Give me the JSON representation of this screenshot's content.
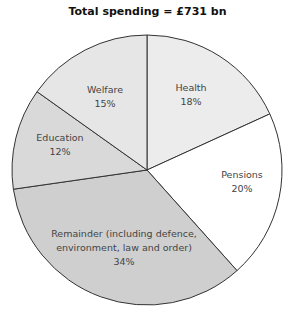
{
  "chart_data": {
    "type": "pie",
    "title": "Total spending = £731 bn",
    "slices": [
      {
        "label": "Health",
        "value": 18,
        "display": "18%",
        "color": "#ececec"
      },
      {
        "label": "Pensions",
        "value": 20,
        "display": "20%",
        "color": "#ffffff"
      },
      {
        "label": "Remainder (including defence, environment, law and order)",
        "value": 34,
        "display": "34%",
        "color": "#cfcfcf"
      },
      {
        "label": "Education",
        "value": 12,
        "display": "12%",
        "color": "#d9d9d9"
      },
      {
        "label": "Welfare",
        "value": 15,
        "display": "15%",
        "color": "#e6e6e6"
      }
    ],
    "labels": {
      "health": "Health",
      "health_pct": "18%",
      "pensions": "Pensions",
      "pensions_pct": "20%",
      "remainder_line1": "Remainder (including defence,",
      "remainder_line2": "environment, law and order)",
      "remainder_pct": "34%",
      "education": "Education",
      "education_pct": "12%",
      "welfare": "Welfare",
      "welfare_pct": "15%"
    }
  }
}
